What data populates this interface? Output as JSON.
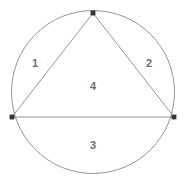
{
  "figure": {
    "type": "geometry-diagram",
    "width": 186,
    "height": 179,
    "background_color": "#ffffff",
    "stroke_color": "#888888",
    "stroke_width": 0.9,
    "vertex_marker_color": "#333333",
    "label_color": "#6d6d6d",
    "circle": {
      "center_x": 93,
      "center_y": 92,
      "radius": 81.5,
      "fill": "none"
    },
    "vertices": [
      {
        "name": "apex",
        "x": 93,
        "y": 13
      },
      {
        "name": "bottom-left",
        "x": 12,
        "y": 117
      },
      {
        "name": "bottom-right",
        "x": 174,
        "y": 117
      }
    ],
    "edges": [
      {
        "name": "left-side",
        "from": "bottom-left",
        "to": "apex"
      },
      {
        "name": "right-side",
        "from": "apex",
        "to": "bottom-right"
      },
      {
        "name": "base",
        "from": "bottom-left",
        "to": "bottom-right"
      }
    ],
    "regions": [
      {
        "id": "region-1",
        "label": "1",
        "description": "left circular segment",
        "x": 35,
        "y": 64
      },
      {
        "id": "region-2",
        "label": "2",
        "description": "right circular segment",
        "x": 149,
        "y": 64
      },
      {
        "id": "region-3",
        "label": "3",
        "description": "bottom circular segment",
        "x": 93,
        "y": 146
      },
      {
        "id": "region-4",
        "label": "4",
        "description": "triangle interior",
        "x": 93,
        "y": 87
      }
    ]
  }
}
